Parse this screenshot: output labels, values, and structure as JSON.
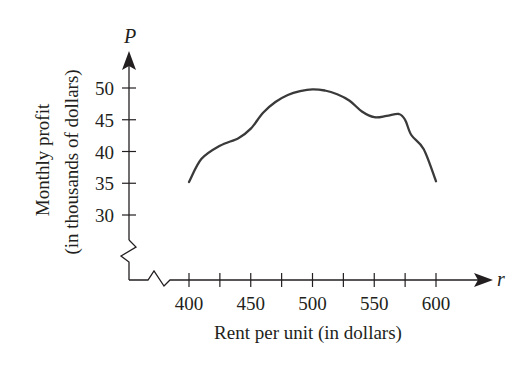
{
  "chart_data": {
    "type": "line",
    "title": "",
    "xlabel": "Rent per unit (in dollars)",
    "ylabel_line1": "Monthly profit",
    "ylabel_line2": "(in thousands of dollars)",
    "x_axis_variable": "r",
    "y_axis_variable": "P",
    "x_ticks": [
      400,
      450,
      500,
      550,
      600
    ],
    "x_minor_ticks": [
      425,
      475,
      525,
      575
    ],
    "y_ticks": [
      30,
      35,
      40,
      45,
      50
    ],
    "xlim": [
      400,
      600
    ],
    "ylim": [
      30,
      50
    ],
    "axis_breaks": {
      "x": true,
      "y": true
    },
    "grid": false,
    "legend": null,
    "series": [
      {
        "name": "P(r)",
        "color": "#3a3a3a",
        "x": [
          400,
          410,
          425,
          440,
          450,
          460,
          470,
          480,
          490,
          500,
          510,
          520,
          530,
          540,
          550,
          560,
          570,
          575,
          580,
          590,
          600
        ],
        "y": [
          35.2,
          38.8,
          40.9,
          42.1,
          43.6,
          46.1,
          47.8,
          48.9,
          49.5,
          49.8,
          49.6,
          49.0,
          48.0,
          46.3,
          45.4,
          45.6,
          45.9,
          45.0,
          42.6,
          40.4,
          35.3
        ]
      }
    ]
  },
  "labels": {
    "x_tick_labels": [
      "400",
      "450",
      "500",
      "550",
      "600"
    ],
    "y_tick_labels": [
      "50",
      "45",
      "40",
      "35",
      "30"
    ],
    "x_axis_title": "Rent per unit (in dollars)",
    "y_axis_title_line1": "Monthly profit",
    "y_axis_title_line2": "(in thousands of dollars)",
    "x_var": "r",
    "y_var": "P"
  }
}
